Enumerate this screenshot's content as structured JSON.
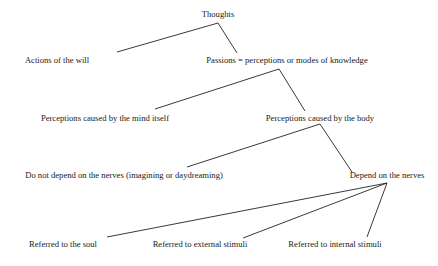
{
  "diagram": {
    "type": "tree",
    "nodes": {
      "thoughts": {
        "label": "Thoughts",
        "x": 218,
        "y": 10
      },
      "actions": {
        "label": "Actions of the will",
        "x": 57,
        "y": 56
      },
      "passions": {
        "label": "Passions = perceptions or modes of knowledge",
        "x": 287,
        "y": 56
      },
      "mind": {
        "label": "Perceptions caused by the mind itself",
        "x": 105,
        "y": 114
      },
      "body": {
        "label": "Perceptions caused by the body",
        "x": 320,
        "y": 114
      },
      "no_nerves": {
        "label": "Do not depend on the nerves (imagining or daydreaming)",
        "x": 124,
        "y": 171
      },
      "nerves": {
        "label": "Depend on the nerves",
        "x": 387,
        "y": 171
      },
      "soul": {
        "label": "Referred to the soul",
        "x": 63,
        "y": 240
      },
      "external": {
        "label": "Referred to external stimuli",
        "x": 200,
        "y": 240
      },
      "internal": {
        "label": "Referred to internal stimuli",
        "x": 335,
        "y": 240
      }
    },
    "edges": [
      {
        "from": "thoughts",
        "to": "actions",
        "x1": 218,
        "y1": 23,
        "x2": 117,
        "y2": 52
      },
      {
        "from": "thoughts",
        "to": "passions",
        "x1": 218,
        "y1": 23,
        "x2": 237,
        "y2": 53
      },
      {
        "from": "passions",
        "to": "mind",
        "x1": 279,
        "y1": 69,
        "x2": 155,
        "y2": 109
      },
      {
        "from": "passions",
        "to": "body",
        "x1": 279,
        "y1": 69,
        "x2": 305,
        "y2": 111
      },
      {
        "from": "body",
        "to": "no_nerves",
        "x1": 320,
        "y1": 124,
        "x2": 187,
        "y2": 167
      },
      {
        "from": "body",
        "to": "nerves",
        "x1": 320,
        "y1": 124,
        "x2": 352,
        "y2": 172
      },
      {
        "from": "nerves",
        "to": "soul",
        "x1": 387,
        "y1": 183,
        "x2": 107,
        "y2": 237
      },
      {
        "from": "nerves",
        "to": "external",
        "x1": 387,
        "y1": 183,
        "x2": 243,
        "y2": 238
      },
      {
        "from": "nerves",
        "to": "internal",
        "x1": 387,
        "y1": 183,
        "x2": 367,
        "y2": 237
      }
    ]
  }
}
